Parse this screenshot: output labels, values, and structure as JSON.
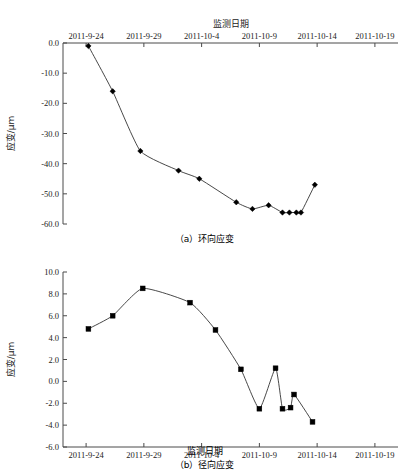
{
  "page": {
    "width": 409,
    "height": 476,
    "background": "#ffffff",
    "ink": "#222222"
  },
  "labels": {
    "x_axis_title": "监测日期",
    "y_axis_title": "应变/μm",
    "caption_a": "（a）环向应变",
    "caption_b": "（b）径向应变"
  },
  "chart_data": [
    {
      "id": "chart-a",
      "type": "line",
      "title": "",
      "xlabel": "监测日期",
      "ylabel": "应变/μm",
      "xlabel_position": "top",
      "x_tick_labels": [
        "2011-9-24",
        "2011-9-29",
        "2011-10-4",
        "2011-10-9",
        "2011-10-14",
        "2011-10-19"
      ],
      "x_tick_values": [
        0,
        5,
        10,
        15,
        20,
        25
      ],
      "xlim": [
        -2,
        27
      ],
      "ylim": [
        -60,
        0
      ],
      "y_tick_labels": [
        "0.0",
        "-10.0",
        "-20.0",
        "-30.0",
        "-40.0",
        "-50.0",
        "-60.0"
      ],
      "y_tick_values": [
        0,
        -10,
        -20,
        -30,
        -40,
        -50,
        -60
      ],
      "grid": false,
      "legend": "none",
      "marker": "diamond",
      "x": [
        0.2,
        2.3,
        4.7,
        8.0,
        9.8,
        13.0,
        14.4,
        15.8,
        17.0,
        17.9,
        18.5,
        19.0,
        19.8
      ],
      "values": [
        -1.0,
        -16.0,
        -35.8,
        -42.3,
        -45.0,
        -52.8,
        -55.0,
        -53.8,
        -56.2,
        -56.2,
        -56.2,
        -56.2,
        -47.0
      ],
      "points": [
        {
          "x": 0.2,
          "y": -1.0
        },
        {
          "x": 2.3,
          "y": -16.0
        },
        {
          "x": 4.7,
          "y": -35.8
        },
        {
          "x": 8.0,
          "y": -42.3
        },
        {
          "x": 9.8,
          "y": -45.0
        },
        {
          "x": 13.0,
          "y": -52.8
        },
        {
          "x": 14.4,
          "y": -55.0
        },
        {
          "x": 15.8,
          "y": -53.8
        },
        {
          "x": 17.0,
          "y": -56.2
        },
        {
          "x": 17.6,
          "y": -56.2
        },
        {
          "x": 18.2,
          "y": -56.2
        },
        {
          "x": 18.6,
          "y": -56.2
        },
        {
          "x": 19.8,
          "y": -47.0
        }
      ]
    },
    {
      "id": "chart-b",
      "type": "line",
      "title": "",
      "xlabel": "监测日期",
      "ylabel": "应变/μm",
      "xlabel_position": "bottom",
      "x_tick_labels": [
        "2011-9-24",
        "2011-9-29",
        "2011-10-4",
        "2011-10-9",
        "2011-10-14",
        "2011-10-19"
      ],
      "x_tick_values": [
        0,
        5,
        10,
        15,
        20,
        25
      ],
      "xlim": [
        -2,
        27
      ],
      "ylim": [
        -6,
        10
      ],
      "y_tick_labels": [
        "10.0",
        "8.0",
        "6.0",
        "4.0",
        "2.0",
        "0.0",
        "-2.0",
        "-4.0",
        "-6.0"
      ],
      "y_tick_values": [
        10,
        8,
        6,
        4,
        2,
        0,
        -2,
        -4,
        -6
      ],
      "grid": false,
      "legend": "none",
      "marker": "square",
      "x": [
        0.2,
        2.3,
        4.9,
        9.0,
        11.2,
        13.4,
        15.0,
        16.4,
        17.0,
        17.7,
        18.3,
        19.6
      ],
      "values": [
        4.8,
        6.0,
        8.5,
        7.2,
        4.7,
        1.1,
        -2.5,
        1.2,
        -2.5,
        -2.4,
        -1.2,
        -3.7
      ],
      "points": [
        {
          "x": 0.2,
          "y": 4.8
        },
        {
          "x": 2.3,
          "y": 6.0
        },
        {
          "x": 4.9,
          "y": 8.5
        },
        {
          "x": 9.0,
          "y": 7.2
        },
        {
          "x": 11.2,
          "y": 4.7
        },
        {
          "x": 13.4,
          "y": 1.1
        },
        {
          "x": 15.0,
          "y": -2.5
        },
        {
          "x": 16.4,
          "y": 1.2
        },
        {
          "x": 17.0,
          "y": -2.5
        },
        {
          "x": 17.7,
          "y": -2.4
        },
        {
          "x": 18.0,
          "y": -1.2
        },
        {
          "x": 19.6,
          "y": -3.7
        }
      ]
    }
  ]
}
